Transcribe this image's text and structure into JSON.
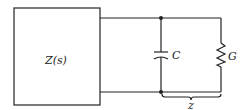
{
  "diagram": {
    "type": "circuit",
    "block_label": "Z(s)",
    "capacitor_label": "C",
    "resistor_label": "G",
    "brace_label": "z",
    "stroke_color": "#222222",
    "background": "#ffffff"
  }
}
